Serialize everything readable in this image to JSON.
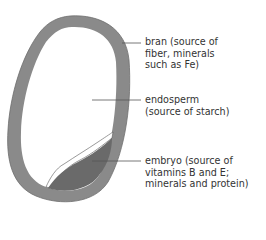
{
  "diagram": {
    "labels": [
      {
        "id": "bran",
        "text": "bran (source of\nfiber, minerals\nsuch as Fe)"
      },
      {
        "id": "endosperm",
        "text": "endosperm\n(source of starch)"
      },
      {
        "id": "embryo",
        "text": "embryo (source of\nvitamins B and E;\nminerals and protein)"
      }
    ],
    "colors": {
      "bran": "#8a8a8a",
      "endosperm": "#ffffff",
      "embryo": "#6a6a6a",
      "leader_line": "#555555",
      "text": "#333333"
    }
  }
}
